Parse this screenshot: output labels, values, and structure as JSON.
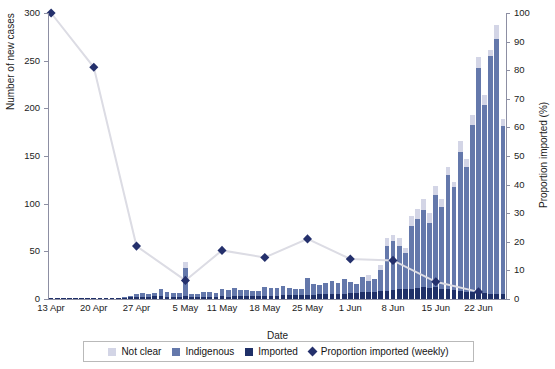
{
  "chart_data": {
    "type": "bar",
    "title": "",
    "xlabel": "Date",
    "ylabel": "Number of new cases",
    "y2label": "Proportion imported (%)",
    "ylim": [
      0,
      300
    ],
    "yticks": [
      0,
      50,
      100,
      150,
      200,
      250,
      300
    ],
    "y2lim": [
      0,
      100
    ],
    "y2ticks": [
      0,
      10,
      20,
      30,
      40,
      50,
      60,
      70,
      80,
      90,
      100
    ],
    "grid": false,
    "legend_position": "bottom",
    "xtick_labels": [
      "13 Apr",
      "20 Apr",
      "27 Apr",
      "5 May",
      "11 May",
      "18 May",
      "25 May",
      "1 Jun",
      "8 Jun",
      "15 Jun",
      "22 Jun"
    ],
    "xtick_indices": [
      0,
      7,
      14,
      22,
      28,
      35,
      42,
      49,
      56,
      63,
      70
    ],
    "categories": [
      "13 Apr",
      "14 Apr",
      "15 Apr",
      "16 Apr",
      "17 Apr",
      "18 Apr",
      "19 Apr",
      "20 Apr",
      "21 Apr",
      "22 Apr",
      "23 Apr",
      "24 Apr",
      "25 Apr",
      "26 Apr",
      "27 Apr",
      "28 Apr",
      "29 Apr",
      "30 Apr",
      "1 May",
      "2 May",
      "3 May",
      "4 May",
      "5 May",
      "6 May",
      "7 May",
      "8 May",
      "9 May",
      "10 May",
      "11 May",
      "12 May",
      "13 May",
      "14 May",
      "15 May",
      "16 May",
      "17 May",
      "18 May",
      "19 May",
      "20 May",
      "21 May",
      "22 May",
      "23 May",
      "24 May",
      "25 May",
      "26 May",
      "27 May",
      "28 May",
      "29 May",
      "30 May",
      "31 May",
      "1 Jun",
      "2 Jun",
      "3 Jun",
      "4 Jun",
      "5 Jun",
      "6 Jun",
      "7 Jun",
      "8 Jun",
      "9 Jun",
      "10 Jun",
      "11 Jun",
      "12 Jun",
      "13 Jun",
      "14 Jun",
      "15 Jun",
      "16 Jun",
      "17 Jun",
      "18 Jun",
      "19 Jun",
      "20 Jun",
      "21 Jun",
      "22 Jun",
      "23 Jun",
      "24 Jun",
      "25 Jun",
      "26 Jun"
    ],
    "series": [
      {
        "name": "Imported",
        "color": "#1f3068",
        "values": [
          1,
          1,
          1,
          1,
          1,
          1,
          1,
          1,
          1,
          1,
          1,
          1,
          1,
          2,
          2,
          2,
          2,
          3,
          3,
          2,
          2,
          2,
          3,
          2,
          2,
          2,
          2,
          2,
          3,
          2,
          3,
          3,
          3,
          3,
          3,
          3,
          3,
          3,
          4,
          4,
          4,
          4,
          4,
          4,
          5,
          5,
          5,
          5,
          5,
          6,
          6,
          7,
          7,
          7,
          8,
          8,
          9,
          10,
          10,
          11,
          12,
          13,
          12,
          13,
          11,
          10,
          9,
          8,
          7,
          7,
          6,
          6,
          5,
          5,
          5
        ]
      },
      {
        "name": "Indigenous",
        "color": "#6478ab",
        "values": [
          0,
          0,
          0,
          0,
          0,
          0,
          0,
          0,
          0,
          0,
          0,
          0,
          1,
          1,
          3,
          4,
          3,
          3,
          7,
          5,
          4,
          4,
          30,
          3,
          3,
          5,
          5,
          4,
          7,
          7,
          9,
          6,
          6,
          5,
          5,
          10,
          9,
          9,
          10,
          8,
          7,
          6,
          18,
          12,
          10,
          12,
          14,
          12,
          16,
          12,
          10,
          16,
          12,
          14,
          22,
          48,
          52,
          46,
          38,
          66,
          72,
          80,
          68,
          96,
          86,
          120,
          108,
          146,
          132,
          176,
          236,
          198,
          250,
          268,
          176
        ]
      },
      {
        "name": "Not clear",
        "color": "#d3d5e6",
        "values": [
          0,
          0,
          0,
          0,
          0,
          0,
          0,
          0,
          0,
          0,
          0,
          0,
          0,
          0,
          0,
          0,
          0,
          0,
          0,
          0,
          0,
          0,
          6,
          0,
          0,
          0,
          0,
          0,
          0,
          0,
          0,
          0,
          0,
          0,
          0,
          0,
          0,
          0,
          0,
          0,
          0,
          0,
          0,
          0,
          0,
          0,
          0,
          0,
          0,
          0,
          0,
          0,
          6,
          0,
          6,
          8,
          6,
          8,
          6,
          10,
          10,
          12,
          10,
          10,
          8,
          8,
          6,
          12,
          8,
          10,
          12,
          10,
          6,
          14,
          8
        ]
      }
    ],
    "line_series": {
      "name": "Proportion imported (weekly)",
      "color": "#24306c",
      "line_color": "#dcdce4",
      "marker": "diamond",
      "points": [
        {
          "index": 0,
          "value": 100
        },
        {
          "index": 7,
          "value": 81
        },
        {
          "index": 14,
          "value": 18.5
        },
        {
          "index": 22,
          "value": 6.5
        },
        {
          "index": 28,
          "value": 17
        },
        {
          "index": 35,
          "value": 14.5
        },
        {
          "index": 42,
          "value": 21
        },
        {
          "index": 49,
          "value": 14
        },
        {
          "index": 56,
          "value": 13.5
        },
        {
          "index": 63,
          "value": 6
        },
        {
          "index": 70,
          "value": 2.5
        }
      ]
    },
    "legend_entries": [
      {
        "label": "Not clear",
        "color": "#d3d5e6",
        "shape": "square"
      },
      {
        "label": "Indigenous",
        "color": "#6478ab",
        "shape": "square"
      },
      {
        "label": "Imported",
        "color": "#1f3068",
        "shape": "square"
      },
      {
        "label": "Proportion imported (weekly)",
        "color": "#24306c",
        "shape": "diamond"
      }
    ]
  }
}
